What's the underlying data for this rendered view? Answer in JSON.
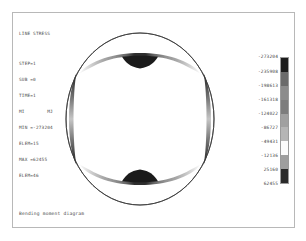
{
  "plot": {
    "title": "LINE STRESS",
    "caption": "Bending moment diagram",
    "annotation": {
      "step": "STEP=1",
      "sub": "SUB =0",
      "time": "TIME=1",
      "components": "MI        MJ",
      "min_value": "MIN =-273204",
      "min_elem": "ELEM=15",
      "max_value": "MAX =62455",
      "max_elem": "ELEM=46"
    }
  },
  "colorbar": {
    "orientation": "vertical",
    "labels": [
      "-273204",
      "-235908",
      "-198613",
      "-161318",
      "-124022",
      "-86727",
      "-49431",
      "-12136",
      "25160",
      "62455"
    ],
    "band_colors": [
      "#1d1d1d",
      "#6b6b6b",
      "#8c8c8c",
      "#7d7d7d",
      "#a0a0a0",
      "#b5b5b5",
      "#fbfbfb",
      "#9e9e9e",
      "#2a2a2a"
    ]
  },
  "chart_data": {
    "type": "contour",
    "title": "LINE STRESS",
    "subtitle": "Bending moment diagram",
    "shape": "circular ring (closed circular beam)",
    "quantity": "Bending moment",
    "units": "",
    "min": -273204,
    "max": 62455,
    "min_element": 15,
    "max_element": 46,
    "contour_levels": [
      -273204,
      -235908,
      -198613,
      -161318,
      -124022,
      -86727,
      -49431,
      -12136,
      25160,
      62455
    ],
    "features": [
      {
        "location": "top",
        "peak_value": -273204,
        "shape": "lens lobe, dark core"
      },
      {
        "location": "bottom",
        "peak_value": -273204,
        "shape": "lens lobe, dark core"
      },
      {
        "location": "left",
        "peak_value": 62455,
        "shape": "thin crescent"
      },
      {
        "location": "right",
        "peak_value": 62455,
        "shape": "thin crescent"
      }
    ],
    "colormap": "grayscale (9 bands)",
    "legend_position": "right"
  }
}
